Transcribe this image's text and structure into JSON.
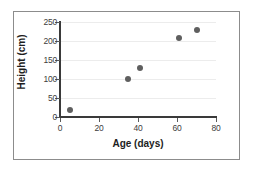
{
  "chart_data": {
    "type": "scatter",
    "title": "",
    "xlabel": "Age (days)",
    "ylabel": "Height (cm)",
    "xlim": [
      0,
      80
    ],
    "ylim": [
      0,
      250
    ],
    "xticks": [
      0,
      20,
      40,
      60,
      80
    ],
    "yticks": [
      0,
      50,
      100,
      150,
      200,
      250
    ],
    "xtick_labels": [
      "0",
      "20",
      "40",
      "60",
      "80"
    ],
    "ytick_labels": [
      "0",
      "50",
      "100",
      "150",
      "200",
      "250"
    ],
    "grid": "horizontal",
    "legend": "none",
    "marker_color": "#5f5f5f",
    "axis_color": "#3a3a3a",
    "grid_color": "#ececec",
    "frame_color": "#8c8c8c",
    "points": [
      {
        "x": 5,
        "y": 18
      },
      {
        "x": 35,
        "y": 100
      },
      {
        "x": 41,
        "y": 128
      },
      {
        "x": 61,
        "y": 208
      },
      {
        "x": 70,
        "y": 229
      }
    ]
  }
}
